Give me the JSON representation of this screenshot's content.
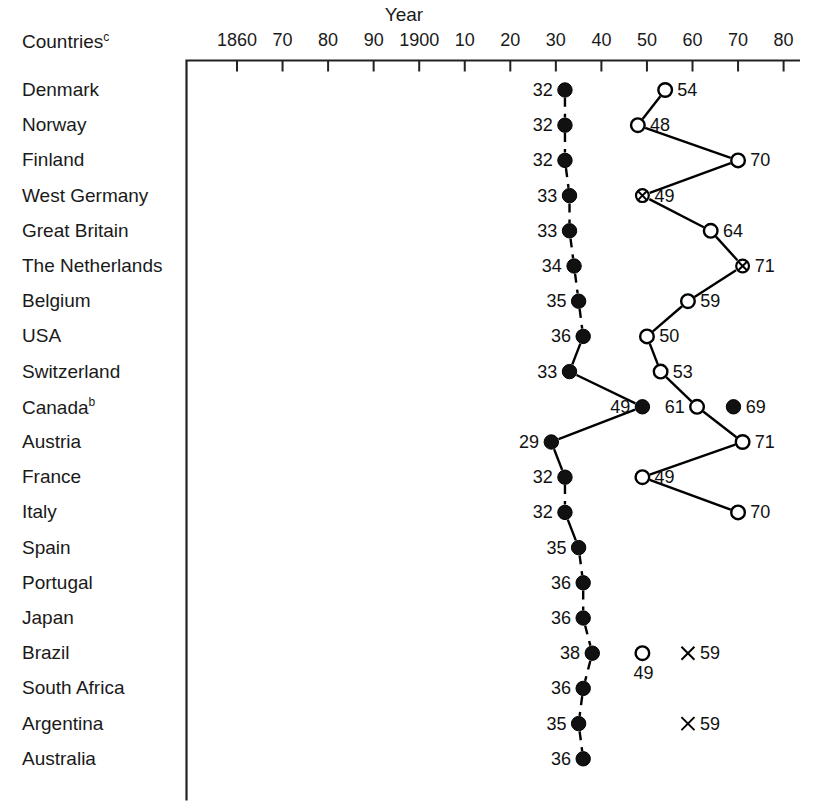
{
  "chart_data": {
    "type": "scatter",
    "title": "Year",
    "xlabel": "Year",
    "ylabel": "Countries",
    "countries_header": "Countries",
    "countries_header_sup": "c",
    "grid": false,
    "legend": null,
    "xlim": [
      1855,
      1985
    ],
    "xticks": [
      1860,
      1870,
      1880,
      1890,
      1900,
      1910,
      1920,
      1930,
      1940,
      1950,
      1960,
      1970,
      1980
    ],
    "xtick_labels": [
      "1860",
      "70",
      "80",
      "90",
      "1900",
      "10",
      "20",
      "30",
      "40",
      "50",
      "60",
      "70",
      "80"
    ],
    "categories": [
      "Denmark",
      "Norway",
      "Finland",
      "West Germany",
      "Great Britain",
      "The Netherlands",
      "Belgium",
      "USA",
      "Switzerland",
      "Canada",
      "Austria",
      "France",
      "Italy",
      "Spain",
      "Portugal",
      "Japan",
      "Brazil",
      "South Africa",
      "Argentina",
      "Australia"
    ],
    "rows": [
      {
        "country": "Denmark",
        "sup": "",
        "markers": [
          {
            "year": 1932,
            "label": "32",
            "style": "filled",
            "label_side": "left"
          },
          {
            "year": 1954,
            "label": "54",
            "style": "open",
            "label_side": "right"
          }
        ]
      },
      {
        "country": "Norway",
        "sup": "",
        "markers": [
          {
            "year": 1932,
            "label": "32",
            "style": "filled",
            "label_side": "left"
          },
          {
            "year": 1948,
            "label": "48",
            "style": "open",
            "label_side": "right"
          }
        ]
      },
      {
        "country": "Finland",
        "sup": "",
        "markers": [
          {
            "year": 1932,
            "label": "32",
            "style": "filled",
            "label_side": "left"
          },
          {
            "year": 1970,
            "label": "70",
            "style": "open",
            "label_side": "right"
          }
        ]
      },
      {
        "country": "West Germany",
        "sup": "",
        "markers": [
          {
            "year": 1933,
            "label": "33",
            "style": "filled",
            "label_side": "left"
          },
          {
            "year": 1949,
            "label": "49",
            "style": "x-circle",
            "label_side": "right"
          }
        ]
      },
      {
        "country": "Great Britain",
        "sup": "",
        "markers": [
          {
            "year": 1933,
            "label": "33",
            "style": "filled",
            "label_side": "left"
          },
          {
            "year": 1964,
            "label": "64",
            "style": "open",
            "label_side": "right"
          }
        ]
      },
      {
        "country": "The Netherlands",
        "sup": "",
        "markers": [
          {
            "year": 1934,
            "label": "34",
            "style": "filled",
            "label_side": "left"
          },
          {
            "year": 1971,
            "label": "71",
            "style": "x-circle",
            "label_side": "right"
          }
        ]
      },
      {
        "country": "Belgium",
        "sup": "",
        "markers": [
          {
            "year": 1935,
            "label": "35",
            "style": "filled",
            "label_side": "left"
          },
          {
            "year": 1959,
            "label": "59",
            "style": "open",
            "label_side": "right"
          }
        ]
      },
      {
        "country": "USA",
        "sup": "",
        "markers": [
          {
            "year": 1936,
            "label": "36",
            "style": "filled",
            "label_side": "left"
          },
          {
            "year": 1950,
            "label": "50",
            "style": "open",
            "label_side": "right"
          }
        ]
      },
      {
        "country": "Switzerland",
        "sup": "",
        "markers": [
          {
            "year": 1933,
            "label": "33",
            "style": "filled",
            "label_side": "left"
          },
          {
            "year": 1953,
            "label": "53",
            "style": "open",
            "label_side": "right"
          }
        ]
      },
      {
        "country": "Canada",
        "sup": "b",
        "markers": [
          {
            "year": 1949,
            "label": "49",
            "style": "filled",
            "label_side": "left"
          },
          {
            "year": 1961,
            "label": "61",
            "style": "open",
            "label_side": "left"
          },
          {
            "year": 1969,
            "label": "69",
            "style": "filled",
            "label_side": "right"
          }
        ]
      },
      {
        "country": "Austria",
        "sup": "",
        "markers": [
          {
            "year": 1929,
            "label": "29",
            "style": "filled",
            "label_side": "left"
          },
          {
            "year": 1971,
            "label": "71",
            "style": "open",
            "label_side": "right"
          }
        ]
      },
      {
        "country": "France",
        "sup": "",
        "markers": [
          {
            "year": 1932,
            "label": "32",
            "style": "filled",
            "label_side": "left"
          },
          {
            "year": 1949,
            "label": "49",
            "style": "open",
            "label_side": "right"
          }
        ]
      },
      {
        "country": "Italy",
        "sup": "",
        "markers": [
          {
            "year": 1932,
            "label": "32",
            "style": "filled",
            "label_side": "left"
          },
          {
            "year": 1970,
            "label": "70",
            "style": "open",
            "label_side": "right"
          }
        ]
      },
      {
        "country": "Spain",
        "sup": "",
        "markers": [
          {
            "year": 1935,
            "label": "35",
            "style": "filled",
            "label_side": "left"
          }
        ]
      },
      {
        "country": "Portugal",
        "sup": "",
        "markers": [
          {
            "year": 1936,
            "label": "36",
            "style": "filled",
            "label_side": "left"
          }
        ]
      },
      {
        "country": "Japan",
        "sup": "",
        "markers": [
          {
            "year": 1936,
            "label": "36",
            "style": "filled",
            "label_side": "left"
          }
        ]
      },
      {
        "country": "Brazil",
        "sup": "",
        "markers": [
          {
            "year": 1938,
            "label": "38",
            "style": "filled",
            "label_side": "left"
          },
          {
            "year": 1949,
            "label": "49",
            "style": "open",
            "label_side": "below"
          },
          {
            "year": 1959,
            "label": "59",
            "style": "x-only",
            "label_side": "right"
          }
        ]
      },
      {
        "country": "South Africa",
        "sup": "",
        "markers": [
          {
            "year": 1936,
            "label": "36",
            "style": "filled",
            "label_side": "left"
          }
        ]
      },
      {
        "country": "Argentina",
        "sup": "",
        "markers": [
          {
            "year": 1935,
            "label": "35",
            "style": "filled",
            "label_side": "left"
          },
          {
            "year": 1959,
            "label": "59",
            "style": "x-only",
            "label_side": "right"
          }
        ]
      },
      {
        "country": "Australia",
        "sup": "",
        "markers": [
          {
            "year": 1936,
            "label": "36",
            "style": "filled",
            "label_side": "left"
          }
        ]
      }
    ],
    "series": [
      {
        "name": "first adoption (filled)",
        "values": [
          1932,
          1932,
          1932,
          1933,
          1933,
          1934,
          1935,
          1936,
          1933,
          1949,
          1929,
          1932,
          1932,
          1935,
          1936,
          1936,
          1938,
          1936,
          1935,
          1936
        ]
      },
      {
        "name": "later adoption (open/x)",
        "values": [
          1954,
          1948,
          1970,
          1949,
          1964,
          1971,
          1959,
          1950,
          1953,
          1961,
          1971,
          1949,
          1970,
          null,
          null,
          null,
          1949,
          null,
          1959,
          null
        ]
      },
      {
        "name": "third point",
        "values": [
          null,
          null,
          null,
          null,
          null,
          null,
          null,
          null,
          null,
          1969,
          null,
          null,
          null,
          null,
          null,
          null,
          1959,
          null,
          null,
          null
        ]
      }
    ],
    "colors": {
      "line": "#000000",
      "marker_fill": "#111111",
      "marker_open": "#ffffff",
      "axis": "#222222"
    }
  }
}
